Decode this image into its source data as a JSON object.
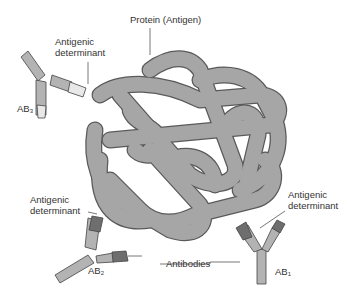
{
  "figure": {
    "labels": {
      "protein": "Protein (Antigen)",
      "determinant_top_line1": "Antigenic",
      "determinant_top_line2": "determinant",
      "determinant_left_line1": "Antigenic",
      "determinant_left_line2": "determinant",
      "determinant_right_line1": "Antigenic",
      "determinant_right_line2": "determinant",
      "antibodies": "Antibodies",
      "ab1_prefix": "AB",
      "ab1_sub": "1",
      "ab2_prefix": "AB",
      "ab2_sub": "2",
      "ab3_prefix": "AB",
      "ab3_sub": "3"
    },
    "colors": {
      "protein_fill": "#a6a6a6",
      "protein_stroke": "#5a5a5a",
      "antibody_fill": "#b3b3b3",
      "binding_site_dark": "#6e6e6e",
      "binding_site_light": "#e8e8e8",
      "leader_line": "#555555",
      "text": "#333333"
    }
  }
}
